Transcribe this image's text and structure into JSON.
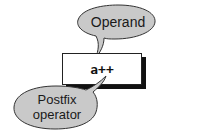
{
  "diagram": {
    "code": "a++",
    "callouts": [
      {
        "id": "operand",
        "label": "Operand",
        "points_to": "a"
      },
      {
        "id": "postfix-operator",
        "label": "Postfix\noperator",
        "points_to": "++"
      }
    ],
    "colors": {
      "bubble_fill": "#c9c9c9",
      "bubble_stroke": "#333333",
      "box_fill": "#ffffff",
      "box_shadow": "#111111"
    }
  }
}
